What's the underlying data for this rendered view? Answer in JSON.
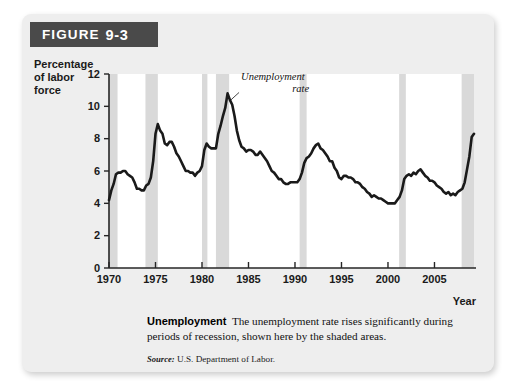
{
  "figure": {
    "header_label": "FIGURE",
    "header_number": "9-3"
  },
  "caption": {
    "lead": "Unemployment",
    "body": "The unemployment rate rises significantly during periods of recession, shown here by the shaded areas.",
    "source_label": "Source:",
    "source_text": "U.S. Department of Labor."
  },
  "chart_data": {
    "type": "line",
    "title": "",
    "xlabel": "Year",
    "ylabel": "Percentage of labor force",
    "ylabel_lines": [
      "Percentage",
      "of labor",
      "force"
    ],
    "xlim": [
      1970,
      2009.25
    ],
    "ylim": [
      0,
      12
    ],
    "ytick_values": [
      0,
      2,
      4,
      6,
      8,
      10,
      12
    ],
    "ytick_labels": [
      "0",
      "2",
      "4",
      "6",
      "8",
      "10",
      "12"
    ],
    "xtick_values": [
      1970,
      1975,
      1980,
      1985,
      1990,
      1995,
      2000,
      2005
    ],
    "xtick_labels": [
      "1970",
      "1975",
      "1980",
      "1985",
      "1990",
      "1995",
      "2000",
      "2005"
    ],
    "grid": false,
    "legend": "none",
    "annotations": [
      {
        "text_lines": [
          "Unemployment",
          "rate"
        ],
        "text": "Unemployment rate",
        "points_to_x": 1982.9,
        "points_to_y": 10.4,
        "label_x": 1984.2,
        "label_y": 11.6,
        "style": "italic-leader-line"
      }
    ],
    "shaded_bands_label": "recessions",
    "shaded_bands_color": "#d9d9d9",
    "shaded_bands": [
      {
        "start": 1969.9,
        "end": 1970.92
      },
      {
        "start": 1973.92,
        "end": 1975.25
      },
      {
        "start": 1980.0,
        "end": 1980.58
      },
      {
        "start": 1981.5,
        "end": 1982.92
      },
      {
        "start": 1990.5,
        "end": 1991.25
      },
      {
        "start": 2001.2,
        "end": 2001.92
      },
      {
        "start": 2007.92,
        "end": 2009.25
      }
    ],
    "line_color": "#1a1a1a",
    "line_width_px": 2.6,
    "series": [
      {
        "name": "Unemployment rate",
        "units": "percent of labor force",
        "x": [
          1970.0,
          1970.25,
          1970.5,
          1970.75,
          1971.0,
          1971.25,
          1971.5,
          1971.75,
          1972.0,
          1972.25,
          1972.5,
          1972.75,
          1973.0,
          1973.25,
          1973.5,
          1973.75,
          1974.0,
          1974.25,
          1974.5,
          1974.75,
          1975.0,
          1975.25,
          1975.5,
          1975.75,
          1976.0,
          1976.25,
          1976.5,
          1976.75,
          1977.0,
          1977.25,
          1977.5,
          1977.75,
          1978.0,
          1978.25,
          1978.5,
          1978.75,
          1979.0,
          1979.25,
          1979.5,
          1979.75,
          1980.0,
          1980.25,
          1980.5,
          1980.75,
          1981.0,
          1981.25,
          1981.5,
          1981.75,
          1982.0,
          1982.25,
          1982.5,
          1982.75,
          1983.0,
          1983.25,
          1983.5,
          1983.75,
          1984.0,
          1984.25,
          1984.5,
          1984.75,
          1985.0,
          1985.25,
          1985.5,
          1985.75,
          1986.0,
          1986.25,
          1986.5,
          1986.75,
          1987.0,
          1987.25,
          1987.5,
          1987.75,
          1988.0,
          1988.25,
          1988.5,
          1988.75,
          1989.0,
          1989.25,
          1989.5,
          1989.75,
          1990.0,
          1990.25,
          1990.5,
          1990.75,
          1991.0,
          1991.25,
          1991.5,
          1991.75,
          1992.0,
          1992.25,
          1992.5,
          1992.75,
          1993.0,
          1993.25,
          1993.5,
          1993.75,
          1994.0,
          1994.25,
          1994.5,
          1994.75,
          1995.0,
          1995.25,
          1995.5,
          1995.75,
          1996.0,
          1996.25,
          1996.5,
          1996.75,
          1997.0,
          1997.25,
          1997.5,
          1997.75,
          1998.0,
          1998.25,
          1998.5,
          1998.75,
          1999.0,
          1999.25,
          1999.5,
          1999.75,
          2000.0,
          2000.25,
          2000.5,
          2000.75,
          2001.0,
          2001.25,
          2001.5,
          2001.75,
          2002.0,
          2002.25,
          2002.5,
          2002.75,
          2003.0,
          2003.25,
          2003.5,
          2003.75,
          2004.0,
          2004.25,
          2004.5,
          2004.75,
          2005.0,
          2005.25,
          2005.5,
          2005.75,
          2006.0,
          2006.25,
          2006.5,
          2006.75,
          2007.0,
          2007.25,
          2007.5,
          2007.75,
          2008.0,
          2008.25,
          2008.5,
          2008.75,
          2009.0,
          2009.25
        ],
        "y": [
          4.2,
          4.8,
          5.2,
          5.8,
          5.9,
          5.9,
          6.0,
          6.0,
          5.8,
          5.7,
          5.6,
          5.3,
          4.9,
          4.9,
          4.8,
          4.8,
          5.1,
          5.2,
          5.6,
          6.6,
          8.3,
          8.9,
          8.5,
          8.3,
          7.7,
          7.6,
          7.8,
          7.8,
          7.5,
          7.1,
          6.9,
          6.6,
          6.3,
          6.0,
          6.0,
          5.9,
          5.9,
          5.7,
          5.9,
          6.0,
          6.3,
          7.3,
          7.7,
          7.5,
          7.4,
          7.4,
          7.4,
          8.3,
          8.8,
          9.4,
          9.9,
          10.8,
          10.4,
          10.1,
          9.4,
          8.5,
          7.9,
          7.5,
          7.4,
          7.2,
          7.3,
          7.3,
          7.2,
          7.0,
          7.0,
          7.2,
          7.0,
          6.8,
          6.6,
          6.3,
          6.0,
          5.9,
          5.7,
          5.5,
          5.5,
          5.3,
          5.2,
          5.2,
          5.3,
          5.3,
          5.3,
          5.3,
          5.5,
          5.9,
          6.5,
          6.8,
          6.9,
          7.1,
          7.4,
          7.6,
          7.7,
          7.4,
          7.3,
          7.1,
          6.9,
          6.6,
          6.6,
          6.2,
          6.0,
          5.6,
          5.5,
          5.7,
          5.7,
          5.6,
          5.6,
          5.5,
          5.3,
          5.3,
          5.2,
          5.0,
          4.9,
          4.7,
          4.6,
          4.4,
          4.5,
          4.4,
          4.3,
          4.3,
          4.2,
          4.1,
          4.0,
          4.0,
          4.0,
          4.0,
          4.2,
          4.4,
          4.8,
          5.5,
          5.7,
          5.8,
          5.7,
          5.9,
          5.8,
          6.0,
          6.1,
          5.9,
          5.7,
          5.6,
          5.4,
          5.4,
          5.3,
          5.1,
          5.0,
          4.9,
          4.7,
          4.6,
          4.7,
          4.5,
          4.6,
          4.5,
          4.7,
          4.8,
          4.9,
          5.3,
          6.1,
          6.9,
          8.1,
          8.3
        ]
      }
    ]
  }
}
